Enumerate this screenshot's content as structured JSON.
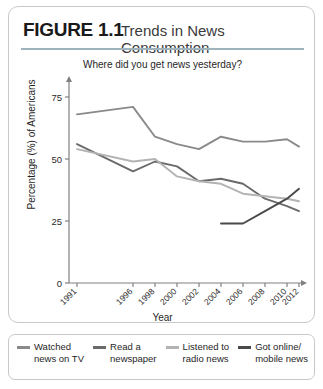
{
  "figure": {
    "number": "FIGURE 1.1",
    "title": "Trends in News Consumption"
  },
  "chart_data": {
    "type": "line",
    "title": "Trends in News Consumption",
    "subtitle": "Where did you get news yesterday?",
    "xlabel": "Year",
    "ylabel": "Percentage (%) of Americans",
    "ylim": [
      0,
      80
    ],
    "yticks": [
      0,
      25,
      50,
      75
    ],
    "ytick_labels": [
      "0",
      "25",
      "50",
      "75"
    ],
    "xlim": [
      1990,
      2013
    ],
    "xticks": [
      1991,
      1996,
      1998,
      2000,
      2002,
      2004,
      2006,
      2008,
      2010,
      2012
    ],
    "xtick_labels": [
      "1991",
      "1996",
      "1998",
      "2000",
      "2002",
      "2004",
      "2006",
      "2008",
      "2010",
      "2012"
    ],
    "grid": false,
    "legend_position": "below",
    "series": [
      {
        "name": "Watched news on TV",
        "color": "#8a8a8a",
        "x": [
          1991,
          1996,
          1998,
          2000,
          2002,
          2004,
          2006,
          2008,
          2010,
          2012
        ],
        "values": [
          68,
          71,
          59,
          56,
          54,
          59,
          57,
          57,
          58,
          55
        ]
      },
      {
        "name": "Read a newspaper",
        "color": "#6a6a6a",
        "x": [
          1991,
          1996,
          1998,
          2000,
          2002,
          2004,
          2006,
          2008,
          2010,
          2012
        ],
        "values": [
          56,
          45,
          49,
          47,
          41,
          42,
          40,
          34,
          31,
          29
        ]
      },
      {
        "name": "Listened to radio news",
        "color": "#b3b3b3",
        "x": [
          1991,
          1996,
          1998,
          2000,
          2002,
          2004,
          2006,
          2008,
          2010,
          2012
        ],
        "values": [
          54,
          49,
          50,
          43,
          41,
          40,
          36,
          35,
          34,
          33
        ]
      },
      {
        "name": "Got online/mobile news",
        "color": "#4a4a4a",
        "x": [
          2004,
          2006,
          2008,
          2010,
          2012
        ],
        "values": [
          24,
          24,
          29,
          34,
          38
        ]
      }
    ]
  },
  "legend": {
    "items": [
      {
        "line1": "Watched",
        "line2": "news on TV",
        "color": "#8a8a8a"
      },
      {
        "line1": "Read a",
        "line2": "newspaper",
        "color": "#6a6a6a"
      },
      {
        "line1": "Listened to",
        "line2": "radio news",
        "color": "#b3b3b3"
      },
      {
        "line1": "Got online/",
        "line2": "mobile news",
        "color": "#4a4a4a"
      }
    ]
  }
}
